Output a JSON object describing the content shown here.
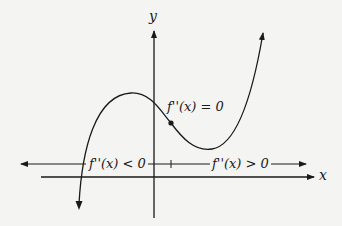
{
  "diagram": {
    "axes": {
      "x_label": "x",
      "y_label": "y"
    },
    "inflection_label": "f''(x) = 0",
    "left_interval_label": "f''(x) < 0",
    "right_interval_label": "f''(x) > 0",
    "colors": {
      "line": "#1a1a1a",
      "background": "#f4f4f2"
    }
  }
}
